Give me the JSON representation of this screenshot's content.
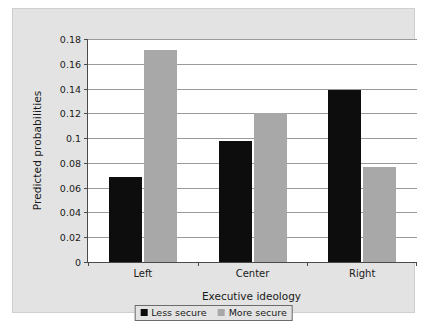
{
  "chart_data": {
    "type": "bar",
    "title": "",
    "xlabel": "Executive ideology",
    "ylabel": "Predicted probabilities",
    "categories": [
      "Left",
      "Center",
      "Right"
    ],
    "series": [
      {
        "name": "Less secure",
        "color": "#0d0d0d",
        "values": [
          0.069,
          0.098,
          0.139
        ]
      },
      {
        "name": "More secure",
        "color": "#a8a8a8",
        "values": [
          0.171,
          0.12,
          0.077
        ]
      }
    ],
    "ylim": [
      0,
      0.18
    ],
    "ytick_values": [
      0,
      0.02,
      0.04,
      0.06,
      0.08,
      0.1,
      0.12,
      0.14,
      0.16,
      0.18
    ],
    "ytick_labels": [
      "0",
      "0.02",
      "0.04",
      "0.06",
      "0.08",
      "0.1",
      "0.12",
      "0.14",
      "0.16",
      "0.18"
    ],
    "grid": true,
    "legend_position": "bottom",
    "legend_entries": [
      "Less secure",
      "More secure"
    ],
    "panel_background": "#e3e3e3",
    "plot_background": "#ffffff"
  }
}
